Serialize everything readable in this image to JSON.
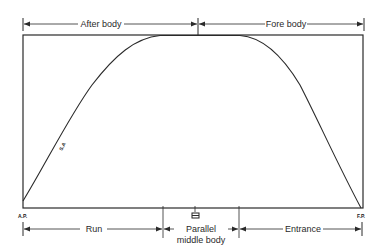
{
  "diagram": {
    "top_dimensions": [
      {
        "label": "After body"
      },
      {
        "label": "Fore body"
      }
    ],
    "bottom_dimensions": [
      {
        "label": "Run"
      },
      {
        "label_line1": "Parallel",
        "label_line2": "middle body"
      },
      {
        "label": "Entrance"
      }
    ],
    "points": {
      "aft": "A.P.",
      "fore": "F.P.",
      "midship_symbol": "midship-symbol"
    },
    "curve_label": "S.A",
    "colors": {
      "line": "#2a2a2a",
      "background": "#ffffff"
    }
  }
}
